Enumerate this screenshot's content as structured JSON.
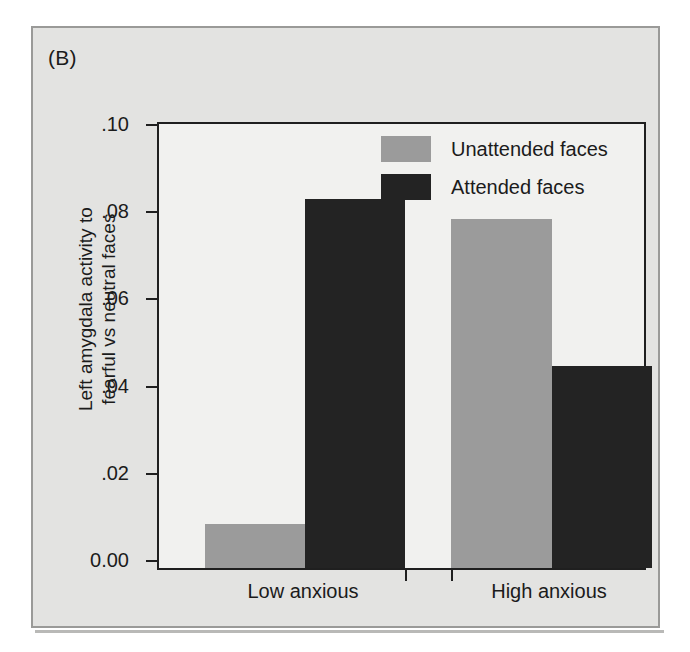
{
  "figure": {
    "panel_label": "(B)"
  },
  "chart_data": {
    "type": "bar",
    "title": "",
    "panel": "(B)",
    "xlabel": "",
    "ylabel": "Left amygdala activity to fearful vs neutral faces",
    "ylabel_line1": "Left amygdala activity to",
    "ylabel_line2": "fearful vs neutral faces",
    "categories": [
      "Low anxious",
      "High anxious"
    ],
    "series": [
      {
        "name": "Unattended faces",
        "color": "#9b9b9b",
        "values": [
          0.01,
          0.0785
        ]
      },
      {
        "name": "Attended faces",
        "color": "#232323",
        "values": [
          0.083,
          0.0455
        ]
      }
    ],
    "ylim": [
      0.0,
      0.1
    ],
    "ytick_values": [
      0.1,
      0.08,
      0.06,
      0.04,
      0.02,
      0.0
    ],
    "ytick_labels": [
      ".10",
      ".08",
      ".06",
      ".04",
      ".02",
      "0.00"
    ],
    "grid": false,
    "legend_position": "top-right-inside",
    "bar_grouping": "adjacent-touching"
  },
  "legend": {
    "items": [
      {
        "label": "Unattended faces",
        "swatch": "gray"
      },
      {
        "label": "Attended faces",
        "swatch": "dark"
      }
    ]
  },
  "colors": {
    "unattended": "#9b9b9b",
    "attended": "#232323",
    "figure_background": "#e3e3e1",
    "plot_background": "#f1f1ef",
    "axis": "#1f1f1f"
  }
}
